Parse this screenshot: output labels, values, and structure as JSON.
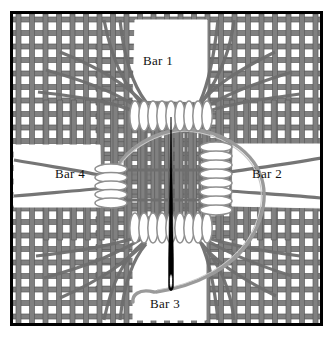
{
  "figure": {
    "background_color": "#ffffff",
    "frame": {
      "name": "outer-border",
      "color": "#000000",
      "x": 10,
      "y": 11,
      "width": 313,
      "height": 315,
      "stroke_width": 3
    },
    "mesh": {
      "band_color": "#808080",
      "band_edge_color": "#5a5a5a",
      "band_width": 5,
      "cell_pitch": 13.5,
      "weave_type": "plain-woven-grid"
    },
    "coil_color_fill": "#ffffff",
    "coil_color_stroke": "#8a8a8a",
    "needle_color": "#000000",
    "thread_color": "#8f8f8f"
  },
  "labels": {
    "bar1": "Bar 1",
    "bar2": "Bar 2",
    "bar3": "Bar 3",
    "bar4": "Bar 4"
  },
  "bars": [
    {
      "id": "bar1",
      "label": "Bar 1",
      "orientation": "vertical",
      "position": "top",
      "x": 135,
      "y": 22,
      "width": 72,
      "height": 80
    },
    {
      "id": "bar2",
      "label": "Bar 2",
      "orientation": "horizontal",
      "position": "right",
      "x": 233,
      "y": 145,
      "width": 84,
      "height": 62
    },
    {
      "id": "bar3",
      "label": "Bar 3",
      "orientation": "vertical",
      "position": "bottom",
      "x": 133,
      "y": 228,
      "width": 72,
      "height": 88
    },
    {
      "id": "bar4",
      "label": "Bar 4",
      "orientation": "horizontal",
      "position": "left",
      "x": 18,
      "y": 145,
      "width": 82,
      "height": 62
    }
  ],
  "coils": [
    {
      "id": "coil-top",
      "name": "coil-suture-top",
      "axis": "horizontal",
      "turns": 9,
      "cx": 171,
      "cy": 116
    },
    {
      "id": "coil-bottom",
      "name": "coil-suture-bottom",
      "axis": "horizontal",
      "turns": 9,
      "cx": 171,
      "cy": 228
    },
    {
      "id": "coil-left",
      "name": "coil-suture-left",
      "axis": "vertical",
      "turns": 5,
      "cx": 111,
      "cy": 186
    },
    {
      "id": "coil-right",
      "name": "coil-suture-right",
      "axis": "vertical",
      "turns": 8,
      "cx": 215,
      "cy": 178
    }
  ],
  "needle": {
    "name": "suture-needle",
    "x": 171,
    "y_top": 117,
    "y_bottom": 294,
    "eye_y": 281,
    "color": "#000000"
  },
  "thread": {
    "name": "suture-thread",
    "color": "#8f8f8f",
    "path_description": "large loop from needle eye curving right and up over the mesh center"
  }
}
